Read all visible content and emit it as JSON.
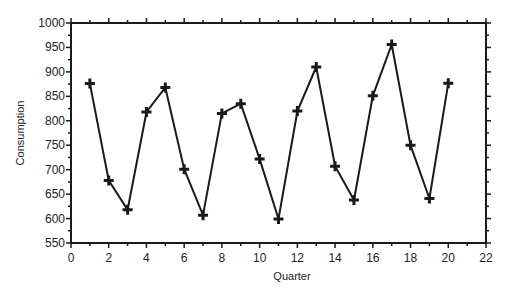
{
  "chart_data": {
    "type": "line",
    "title": "",
    "xlabel": "Quarter",
    "ylabel": "Consumption",
    "xlim": [
      0,
      22
    ],
    "ylim": [
      550,
      1000
    ],
    "x_ticks": [
      0,
      2,
      4,
      6,
      8,
      10,
      12,
      14,
      16,
      18,
      20,
      22
    ],
    "y_ticks": [
      550,
      600,
      650,
      700,
      750,
      800,
      850,
      900,
      950,
      1000
    ],
    "grid": false,
    "legend": null,
    "marker": "plus",
    "line_color": "#1a1a1a",
    "x": [
      1,
      2,
      3,
      4,
      5,
      6,
      7,
      8,
      9,
      10,
      11,
      12,
      13,
      14,
      15,
      16,
      17,
      18,
      19,
      20
    ],
    "series": [
      {
        "name": "Consumption",
        "values": [
          876,
          678,
          618,
          818,
          868,
          701,
          607,
          815,
          835,
          722,
          599,
          820,
          910,
          707,
          638,
          851,
          956,
          750,
          641,
          877
        ]
      }
    ]
  }
}
